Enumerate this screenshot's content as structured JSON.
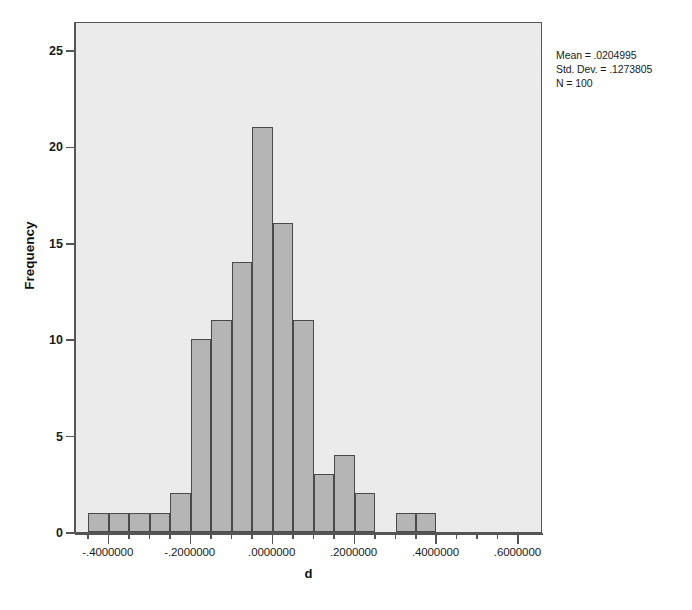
{
  "chart_data": {
    "type": "bar",
    "title": "",
    "subtitle": "",
    "xlabel": "d",
    "ylabel": "Frequency",
    "ylim": [
      0,
      26.5
    ],
    "xlim": [
      -0.48,
      0.66
    ],
    "grid": false,
    "legend": false,
    "bin_width": 0.05,
    "categories": [
      "-0.425",
      "-0.375",
      "-0.325",
      "-0.275",
      "-0.225",
      "-0.175",
      "-0.125",
      "-0.075",
      "-0.025",
      "0.025",
      "0.075",
      "0.125",
      "0.175",
      "0.225",
      "0.275",
      "0.325",
      "0.375",
      "0.425",
      "0.475",
      "0.525"
    ],
    "values": [
      1,
      1,
      1,
      1,
      2,
      10,
      11,
      14,
      21,
      16,
      11,
      3,
      4,
      2,
      0,
      1,
      1,
      0,
      0,
      0
    ],
    "x_tick_labels": [
      "-.4000000",
      "-.2000000",
      ".0000000",
      ".2000000",
      ".4000000",
      ".6000000"
    ],
    "x_tick_values": [
      -0.4,
      -0.2,
      0.0,
      0.2,
      0.4,
      0.6
    ],
    "y_tick_labels": [
      "0",
      "5",
      "10",
      "15",
      "20",
      "25"
    ],
    "y_tick_values": [
      0,
      5,
      10,
      15,
      20,
      25
    ],
    "bar_color": "#b5b5b5",
    "bar_edge_color": "#4a4a4a",
    "plot_background": "#ebebeb"
  },
  "annotation": {
    "mean_line": "Mean = .0204995",
    "stddev_line": "Std. Dev. = .1273805",
    "n_line": "N = 100"
  }
}
